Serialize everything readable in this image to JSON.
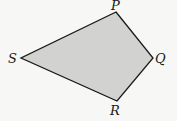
{
  "diagram": {
    "type": "quadrilateral",
    "fill_color": "#d2d2d0",
    "stroke_color": "#1a1a1a",
    "background": "#f7f7f5",
    "vertices": [
      {
        "label": "P",
        "x": 116,
        "y": 12
      },
      {
        "label": "Q",
        "x": 153,
        "y": 58
      },
      {
        "label": "R",
        "x": 117,
        "y": 101
      },
      {
        "label": "S",
        "x": 21,
        "y": 58
      }
    ],
    "labels": {
      "P": "P",
      "Q": "Q",
      "R": "R",
      "S": "S"
    }
  }
}
